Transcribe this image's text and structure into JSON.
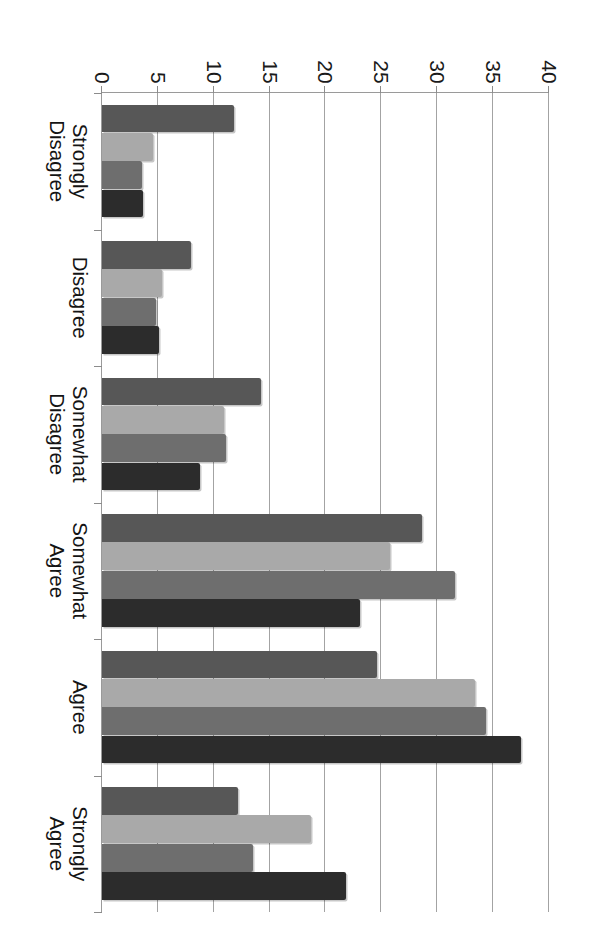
{
  "chart_data": {
    "type": "bar",
    "orientation": "vertical-bars-in-rotated-page",
    "title": "",
    "subtitle": "",
    "xlabel": "",
    "ylabel": "",
    "ylim": [
      0,
      40
    ],
    "ytick_step": 5,
    "grid": true,
    "legend": "none",
    "categories": [
      "Strongly\nDisagree",
      "Disagree",
      "Somewhat\nDisagree",
      "Somewhat\nAgree",
      "Agree",
      "Strongly\nAgree"
    ],
    "ytick_labels": [
      "0",
      "5",
      "10",
      "15",
      "20",
      "25",
      "30",
      "35",
      "40"
    ],
    "ytick_values": [
      0,
      5,
      10,
      15,
      20,
      25,
      30,
      35,
      40
    ],
    "series": [
      {
        "name": "Series 1",
        "color": "#575757",
        "values": [
          11.8,
          8.0,
          14.2,
          28.6,
          24.6,
          12.2
        ]
      },
      {
        "name": "Series 2",
        "color": "#a9a9a9",
        "values": [
          4.6,
          5.4,
          10.9,
          25.8,
          33.4,
          18.7
        ]
      },
      {
        "name": "Series 3",
        "color": "#6e6e6e",
        "values": [
          3.6,
          4.8,
          11.1,
          31.6,
          34.4,
          13.5
        ]
      },
      {
        "name": "Series 4",
        "color": "#2c2c2c",
        "values": [
          3.7,
          5.1,
          8.8,
          23.1,
          37.5,
          21.8
        ]
      }
    ]
  },
  "style": {
    "plot_background": "#ffffff",
    "gridline_color": "#a3a3a3",
    "axis_color": "#9a9a9a",
    "text_color": "#141414"
  }
}
